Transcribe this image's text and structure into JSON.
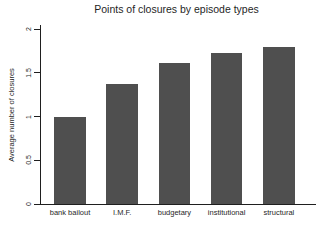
{
  "chart_data": {
    "type": "bar",
    "title": "Points of closures by episode types",
    "xlabel": "",
    "ylabel": "Average number of closures",
    "categories": [
      "bank bailout",
      "I.M.F.",
      "budgetary",
      "institutional",
      "structural"
    ],
    "values": [
      1.0,
      1.37,
      1.61,
      1.73,
      1.8
    ],
    "ylim": [
      0,
      2
    ],
    "ytick_values": [
      0,
      0.5,
      1,
      1.5,
      2
    ],
    "ytick_labels": [
      "0",
      "0.5",
      "1",
      "1.5",
      "2"
    ],
    "grid": false,
    "legend": "none",
    "bar_color": "#4f4f4f",
    "axis_color": "#1f1f1f",
    "text_color": "#1f1f1f",
    "background_color": "#ffffff"
  }
}
